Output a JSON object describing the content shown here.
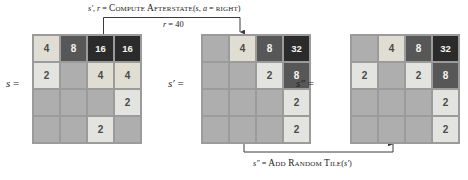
{
  "figure": {
    "top_caption": {
      "prefix_s_prime": "s′",
      "comma": ", ",
      "r": "r",
      "eq": " = ",
      "func": "Compute Afterstate",
      "open": "(",
      "arg_s": "s",
      "arg_sep": ", ",
      "arg_a": "a",
      "arg_eq": " = ",
      "arg_val": "right",
      "close": ")",
      "full_text": "s′, r = Compute Afterstate(s, a = right)"
    },
    "reward_label": {
      "var": "r",
      "eq": " = ",
      "value": "40",
      "full_text": "r = 40"
    },
    "bottom_caption": {
      "prefix": "s″",
      "eq": " = ",
      "func": "Add Random Tile",
      "open": "(",
      "arg": "s′",
      "close": ")",
      "full_text": "s″ = Add Random Tile(s′)"
    }
  },
  "boards": [
    {
      "name": "state",
      "label": "s =",
      "label_symbol": "s",
      "label_eq": "=",
      "grid": [
        [
          "4",
          "8",
          "16",
          "16"
        ],
        [
          "2",
          "",
          "4",
          "4"
        ],
        [
          "",
          "",
          "",
          "2"
        ],
        [
          "",
          "",
          "2",
          ""
        ]
      ]
    },
    {
      "name": "afterstate",
      "label": "s′ =",
      "label_symbol": "s′",
      "label_eq": "=",
      "grid": [
        [
          "",
          "4",
          "8",
          "32"
        ],
        [
          "",
          "",
          "2",
          "8"
        ],
        [
          "",
          "",
          "",
          "2"
        ],
        [
          "",
          "",
          "",
          "2"
        ]
      ]
    },
    {
      "name": "next-state",
      "label": "s″ =",
      "label_symbol": "s″",
      "label_eq": "=",
      "grid": [
        [
          "",
          "4",
          "8",
          "32"
        ],
        [
          "2",
          "",
          "2",
          "8"
        ],
        [
          "",
          "",
          "",
          "2"
        ],
        [
          "",
          "",
          "",
          "2"
        ]
      ]
    }
  ],
  "colors": {
    "board_background": "#9b9b9b",
    "empty_cell": "#aeaeae",
    "tile_2": "#e3e3e0",
    "tile_4": "#e0ded3",
    "tile_8": "#575757",
    "tile_16": "#2b2b2b",
    "tile_32": "#2b2b2b",
    "light_text": "#f7f5ef",
    "dark_text": "#4a4a48",
    "line": "#3a3a3a",
    "page_background": "#ffffff"
  }
}
